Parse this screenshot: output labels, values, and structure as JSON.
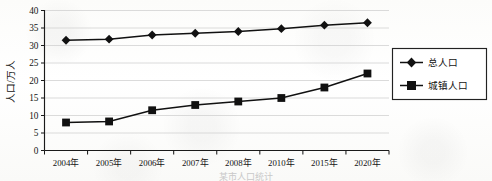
{
  "chart_data": {
    "type": "line",
    "title": "",
    "xlabel": "",
    "ylabel": "人口/万人",
    "categories": [
      "2004年",
      "2005年",
      "2006年",
      "2007年",
      "2008年",
      "2010年",
      "2015年",
      "2020年"
    ],
    "ylim": [
      0,
      40
    ],
    "ytick_step": 5,
    "yticks": [
      "0",
      "5",
      "10",
      "15",
      "20",
      "25",
      "30",
      "35",
      "40"
    ],
    "grid": "horizontal",
    "legend_position": "right",
    "series": [
      {
        "name": "总人口",
        "marker": "diamond",
        "color": "#111111",
        "values": [
          31.5,
          31.8,
          33.0,
          33.5,
          34.0,
          34.8,
          35.8,
          36.5
        ]
      },
      {
        "name": "城镇人口",
        "marker": "square",
        "color": "#111111",
        "values": [
          8.0,
          8.3,
          11.5,
          13.0,
          14.0,
          15.0,
          18.0,
          22.0
        ]
      }
    ]
  },
  "legend": {
    "entries": [
      "总人口",
      "城镇人口"
    ]
  },
  "caption": {
    "cut_off_text": "某市人口统计"
  }
}
